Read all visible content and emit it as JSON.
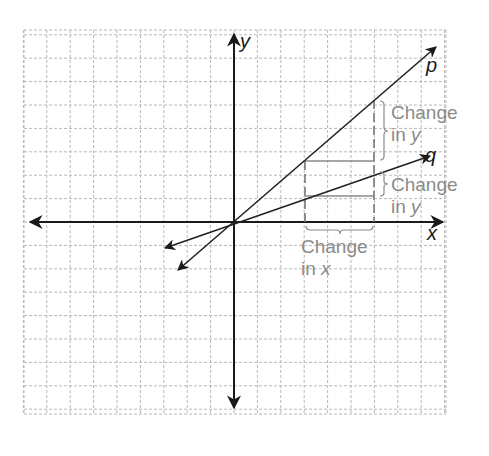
{
  "diagram": {
    "axes": {
      "x_label": "x",
      "y_label": "y"
    },
    "lines": [
      {
        "name": "p",
        "label": "p"
      },
      {
        "name": "q",
        "label": "q"
      }
    ],
    "annotations": {
      "change_y_p": {
        "line1": "Change",
        "line2_prefix": "in ",
        "line2_var": "y"
      },
      "change_y_q": {
        "line1": "Change",
        "line2_prefix": "in ",
        "line2_var": "y"
      },
      "change_x": {
        "line1": "Change",
        "line2_prefix": "in ",
        "line2_var": "x"
      }
    },
    "colors": {
      "axis": "#1a1a1a",
      "grid": "#b8b8b8",
      "annotation": "#8a8a8a"
    }
  }
}
